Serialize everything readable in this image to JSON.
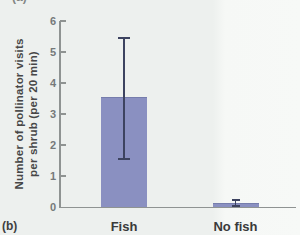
{
  "figure": {
    "panel_label": "(b)",
    "panel_label_top_partial": "(a)"
  },
  "axis": {
    "y_title_line1": "Number of pollinator visits",
    "y_title_line2": "per shrub (per 20 min)"
  },
  "chart_data": {
    "type": "bar",
    "categories": [
      "Fish",
      "No fish"
    ],
    "values": [
      3.55,
      0.12
    ],
    "error_bars": [
      {
        "low": 1.55,
        "high": 5.45
      },
      {
        "low": 0.03,
        "high": 0.24
      }
    ],
    "title": "",
    "xlabel": "",
    "ylabel": "Number of pollinator visits per shrub (per 20 min)",
    "ylim": [
      0,
      6
    ],
    "yticks": [
      0,
      1,
      2,
      3,
      4,
      5,
      6
    ],
    "grid": false,
    "legend": "none",
    "bar_color": "#8a90c1",
    "error_bar_color": "#3d4360",
    "axis_color": "#8f9392"
  }
}
